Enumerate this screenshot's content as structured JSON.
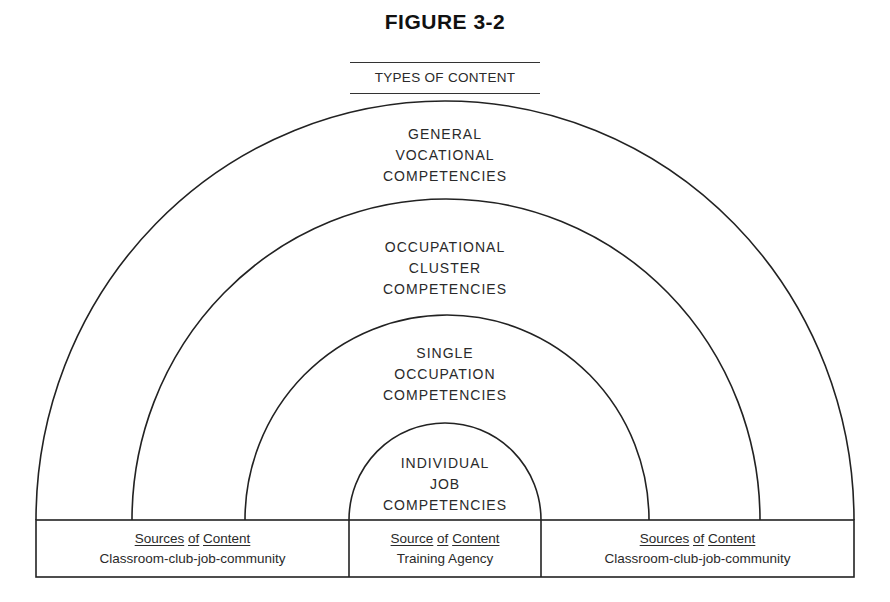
{
  "figure": {
    "title": "FIGURE 3-2",
    "subtitle": "TYPES OF CONTENT"
  },
  "arcs": [
    {
      "id": "general",
      "lines": [
        "GENERAL",
        "VOCATIONAL",
        "COMPETENCIES"
      ]
    },
    {
      "id": "cluster",
      "lines": [
        "OCCUPATIONAL",
        "CLUSTER",
        "COMPETENCIES"
      ]
    },
    {
      "id": "single",
      "lines": [
        "SINGLE",
        "OCCUPATION",
        "COMPETENCIES"
      ]
    },
    {
      "id": "individual",
      "lines": [
        "INDIVIDUAL",
        "JOB",
        "COMPETENCIES"
      ]
    }
  ],
  "sources": {
    "left": {
      "w1": "Sources",
      "w2": "of",
      "w3": "Content",
      "detail": "Classroom-club-job-community"
    },
    "center": {
      "w1": "Source",
      "w2": "of",
      "w3": "Content",
      "detail": "Training Agency"
    },
    "right": {
      "w1": "Sources",
      "w2": "of",
      "w3": "Content",
      "detail": "Classroom-club-job-community"
    }
  },
  "colors": {
    "line": "#222222",
    "text": "#2a2a2a",
    "background": "#ffffff"
  }
}
